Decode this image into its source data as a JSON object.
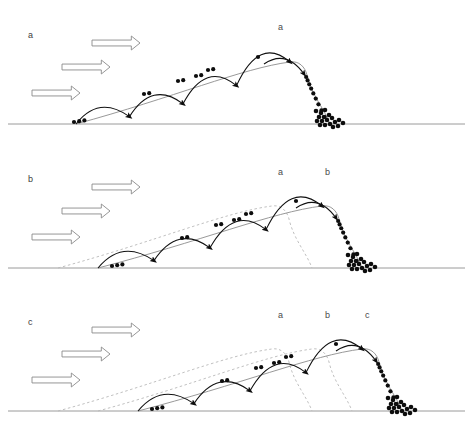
{
  "figure": {
    "type": "scientific-diagram",
    "width": 473,
    "height": 433,
    "background_color": "#ffffff",
    "colors": {
      "grain": "#0d0d0d",
      "hop_path": "#111111",
      "dune_current": "#8d8d8d",
      "dune_previous": "#b9b9b9",
      "ground": "#9a9a9a",
      "wind_arrow_fill": "#ffffff",
      "wind_arrow_stroke": "#8a8a8a",
      "label_text": "#3d3d3d"
    }
  },
  "panels": [
    {
      "id": "panel-a",
      "label": "a",
      "label_x": 28,
      "label_y": 38,
      "baseline_y": 124,
      "wind_arrows": [
        {
          "x": 92,
          "y": 36,
          "width": 48,
          "height": 14
        },
        {
          "x": 62,
          "y": 60,
          "width": 48,
          "height": 14
        },
        {
          "x": 32,
          "y": 86,
          "width": 48,
          "height": 14
        }
      ],
      "crest_labels": [
        {
          "text": "a",
          "x": 278,
          "y": 30,
          "style": "current"
        }
      ],
      "dunes": [
        {
          "name": "dune-current-a",
          "style": "current",
          "toe_x": 76,
          "crest_x": 290,
          "crest_y": 62,
          "slipface_toe_x": 330
        }
      ],
      "grain_clusters": [
        {
          "x": 74,
          "y": 122,
          "count": 3
        },
        {
          "x": 144,
          "y": 94,
          "count": 2
        },
        {
          "x": 178,
          "y": 81,
          "count": 2
        },
        {
          "x": 196,
          "y": 76,
          "count": 2
        },
        {
          "x": 208,
          "y": 70,
          "count": 2
        },
        {
          "x": 258,
          "y": 57,
          "count": 1
        }
      ],
      "hop_count": 4,
      "slipface_grain_count": 9,
      "toe_pile_count": 18
    },
    {
      "id": "panel-b",
      "label": "b",
      "label_x": 28,
      "label_y": 182,
      "baseline_y": 268,
      "wind_arrows": [
        {
          "x": 92,
          "y": 180,
          "width": 48,
          "height": 14
        },
        {
          "x": 62,
          "y": 204,
          "width": 48,
          "height": 14
        },
        {
          "x": 32,
          "y": 230,
          "width": 48,
          "height": 14
        }
      ],
      "crest_labels": [
        {
          "text": "a",
          "x": 278,
          "y": 175,
          "style": "previous"
        },
        {
          "text": "b",
          "x": 325,
          "y": 175,
          "style": "current"
        }
      ],
      "dunes": [
        {
          "name": "dune-previous-a",
          "style": "previous",
          "toe_x": 58,
          "crest_x": 272,
          "crest_y": 206,
          "slipface_toe_x": 312
        },
        {
          "name": "dune-current-b",
          "style": "current",
          "toe_x": 98,
          "crest_x": 322,
          "crest_y": 206,
          "slipface_toe_x": 362
        }
      ],
      "grain_clusters": [
        {
          "x": 112,
          "y": 266,
          "count": 3
        },
        {
          "x": 182,
          "y": 238,
          "count": 2
        },
        {
          "x": 216,
          "y": 225,
          "count": 2
        },
        {
          "x": 234,
          "y": 220,
          "count": 2
        },
        {
          "x": 246,
          "y": 214,
          "count": 2
        },
        {
          "x": 296,
          "y": 201,
          "count": 1
        }
      ],
      "hop_count": 4,
      "slipface_grain_count": 9,
      "toe_pile_count": 18
    },
    {
      "id": "panel-c",
      "label": "c",
      "label_x": 28,
      "label_y": 325,
      "baseline_y": 411,
      "wind_arrows": [
        {
          "x": 92,
          "y": 323,
          "width": 48,
          "height": 14
        },
        {
          "x": 62,
          "y": 347,
          "width": 48,
          "height": 14
        },
        {
          "x": 32,
          "y": 373,
          "width": 48,
          "height": 14
        }
      ],
      "crest_labels": [
        {
          "text": "a",
          "x": 278,
          "y": 318,
          "style": "previous"
        },
        {
          "text": "b",
          "x": 325,
          "y": 318,
          "style": "previous"
        },
        {
          "text": "c",
          "x": 365,
          "y": 318,
          "style": "current"
        }
      ],
      "dunes": [
        {
          "name": "dune-previous-a",
          "style": "previous",
          "toe_x": 58,
          "crest_x": 272,
          "crest_y": 349,
          "slipface_toe_x": 312
        },
        {
          "name": "dune-previous-b",
          "style": "previous",
          "toe_x": 98,
          "crest_x": 312,
          "crest_y": 349,
          "slipface_toe_x": 352
        },
        {
          "name": "dune-current-c",
          "style": "current",
          "toe_x": 138,
          "crest_x": 362,
          "crest_y": 349,
          "slipface_toe_x": 402
        }
      ],
      "grain_clusters": [
        {
          "x": 152,
          "y": 409,
          "count": 3
        },
        {
          "x": 222,
          "y": 381,
          "count": 2
        },
        {
          "x": 256,
          "y": 368,
          "count": 2
        },
        {
          "x": 274,
          "y": 363,
          "count": 2
        },
        {
          "x": 286,
          "y": 357,
          "count": 2
        },
        {
          "x": 336,
          "y": 344,
          "count": 1
        }
      ],
      "hop_count": 4,
      "slipface_grain_count": 9,
      "toe_pile_count": 18
    }
  ],
  "caption": {
    "text": ""
  }
}
